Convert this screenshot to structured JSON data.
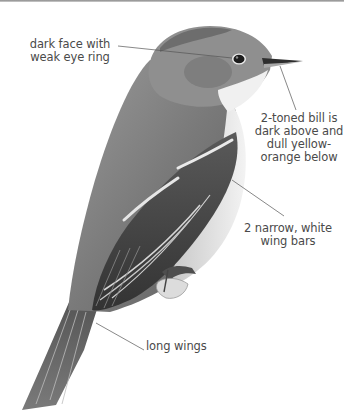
{
  "figure": {
    "colors": {
      "background": "#ffffff",
      "label_text": "#4a4a4a",
      "leader_line": "#555555",
      "plumage_dark": "#3e3e3e",
      "plumage_mid": "#7d7d7d",
      "plumage_light": "#b8b8b8",
      "throat": "#eeeeee"
    },
    "annotations": [
      {
        "id": "face",
        "text_line1": "dark face with",
        "text_line2": "weak eye ring"
      },
      {
        "id": "bill",
        "text_line1": "2-toned bill is",
        "text_line2": "dark above and",
        "text_line3": "dull yellow-",
        "text_line4": "orange below"
      },
      {
        "id": "wingbars",
        "text_line1": "2 narrow, white",
        "text_line2": "wing bars"
      },
      {
        "id": "wings",
        "text_line1": "long wings"
      }
    ]
  }
}
